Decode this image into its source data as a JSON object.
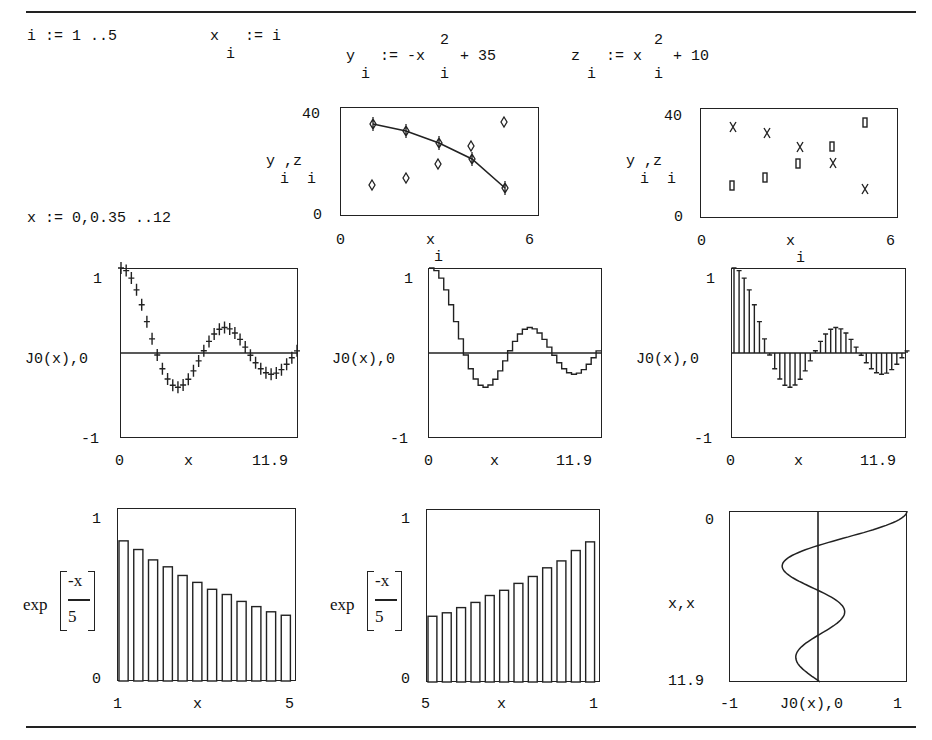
{
  "definitions": {
    "i_range": "i := 1 ..5",
    "x_def": {
      "lhs": "x",
      "sub": "i",
      "rhs": ":= i"
    },
    "y_def": {
      "lhs": "y",
      "sub": "i",
      "assign": ":= -x",
      "sup": "2",
      "sub2": "i",
      "tail": "+ 35"
    },
    "z_def": {
      "lhs": "z",
      "sub": "i",
      "assign": ":= x",
      "sup": "2",
      "sub2": "i",
      "tail": "+ 10"
    },
    "x_range": "x := 0,0.35 ..12"
  },
  "plots": {
    "scatter_line": {
      "ylabel_main": "y ,z",
      "ylabel_subs": "i  i",
      "ymax": "40",
      "ymin": "0",
      "xmin": "0",
      "xmax": "6",
      "xlabel": "x",
      "xlabel_sub": "i"
    },
    "scatter_points": {
      "ylabel_main": "y ,z",
      "ylabel_subs": "i  i",
      "ymax": "40",
      "ymin": "0",
      "xmin": "0",
      "xmax": "6",
      "xlabel": "x",
      "xlabel_sub": "i"
    },
    "j0_points": {
      "ylabel": "J0(x),0",
      "ymax": "1",
      "ymin": "-1",
      "xmin": "0",
      "xmax": "11.9",
      "xlabel": "x"
    },
    "j0_steps": {
      "ylabel": "J0(x),0",
      "ymax": "1",
      "ymin": "-1",
      "xmin": "0",
      "xmax": "11.9",
      "xlabel": "x"
    },
    "j0_stems": {
      "ylabel": "J0(x),0",
      "ymax": "1",
      "ymin": "-1",
      "xmin": "0",
      "xmax": "11.9",
      "xlabel": "x"
    },
    "bars_desc": {
      "ylabel_fn": "exp",
      "ylabel_num": "-x",
      "ylabel_den": "5",
      "ymax": "1",
      "ymin": "0",
      "xmin": "1",
      "xmax": "5",
      "xlabel": "x"
    },
    "bars_asc": {
      "ylabel_fn": "exp",
      "ylabel_num": "-x",
      "ylabel_den": "5",
      "ymax": "1",
      "ymin": "0",
      "xmin": "5",
      "xmax": "1",
      "xlabel": "x"
    },
    "j0_rotated": {
      "ylabel": "x,x",
      "ytop": "0",
      "ybottom": "11.9",
      "xmin": "-1",
      "xmax": "1",
      "xlabel": "J0(x),0"
    }
  },
  "chart_data": [
    {
      "type": "scatter",
      "title": "",
      "xlabel": "x_i",
      "ylabel": "y_i, z_i",
      "xlim": [
        0,
        6
      ],
      "ylim": [
        0,
        40
      ],
      "x": [
        1,
        2,
        3,
        4,
        5
      ],
      "series": [
        {
          "name": "y_i (line + diamond markers)",
          "values": [
            34,
            31,
            26,
            19,
            10
          ]
        },
        {
          "name": "z_i (diamond markers)",
          "values": [
            11,
            14,
            19,
            26,
            35
          ]
        }
      ]
    },
    {
      "type": "scatter",
      "title": "",
      "xlabel": "x_i",
      "ylabel": "y_i, z_i",
      "xlim": [
        0,
        6
      ],
      "ylim": [
        0,
        40
      ],
      "x": [
        1,
        2,
        3,
        4,
        5
      ],
      "series": [
        {
          "name": "y_i (x markers)",
          "values": [
            34,
            31,
            26,
            19,
            10
          ]
        },
        {
          "name": "z_i (box markers)",
          "values": [
            11,
            14,
            19,
            26,
            35
          ]
        }
      ]
    },
    {
      "type": "scatter",
      "title": "",
      "xlabel": "x",
      "ylabel": "J0(x), 0",
      "xlim": [
        0,
        11.9
      ],
      "ylim": [
        -1,
        1
      ],
      "series": [
        {
          "name": "J0(x) (+ markers)",
          "function": "besselJ0",
          "x_start": 0,
          "x_step": 0.35,
          "x_end": 11.9
        },
        {
          "name": "0",
          "values": [
            0
          ]
        }
      ]
    },
    {
      "type": "line",
      "title": "",
      "xlabel": "x",
      "ylabel": "J0(x), 0",
      "xlim": [
        0,
        11.9
      ],
      "ylim": [
        -1,
        1
      ],
      "series": [
        {
          "name": "J0(x) (step)",
          "function": "besselJ0",
          "x_start": 0,
          "x_step": 0.35,
          "x_end": 11.9
        },
        {
          "name": "0",
          "values": [
            0
          ]
        }
      ]
    },
    {
      "type": "bar",
      "title": "",
      "xlabel": "x",
      "ylabel": "J0(x), 0",
      "xlim": [
        0,
        11.9
      ],
      "ylim": [
        -1,
        1
      ],
      "series": [
        {
          "name": "J0(x) (stem/error bars)",
          "function": "besselJ0",
          "x_start": 0,
          "x_step": 0.35,
          "x_end": 11.9
        }
      ]
    },
    {
      "type": "bar",
      "title": "",
      "xlabel": "x",
      "ylabel": "exp(-x/5)",
      "xlim": [
        1,
        5
      ],
      "ylim": [
        0,
        1
      ],
      "categories": [
        1.05,
        1.4,
        1.75,
        2.1,
        2.45,
        2.8,
        3.15,
        3.5,
        3.85,
        4.2,
        4.55,
        4.9
      ],
      "values": [
        0.81,
        0.76,
        0.7,
        0.66,
        0.61,
        0.57,
        0.53,
        0.5,
        0.46,
        0.43,
        0.4,
        0.38
      ]
    },
    {
      "type": "bar",
      "title": "",
      "xlabel": "x",
      "ylabel": "exp(-x/5)",
      "xlim": [
        5,
        1
      ],
      "ylim": [
        0,
        1
      ],
      "categories": [
        4.9,
        4.55,
        4.2,
        3.85,
        3.5,
        3.15,
        2.8,
        2.45,
        2.1,
        1.75,
        1.4,
        1.05
      ],
      "values": [
        0.38,
        0.4,
        0.43,
        0.46,
        0.5,
        0.53,
        0.57,
        0.61,
        0.66,
        0.7,
        0.76,
        0.81
      ]
    },
    {
      "type": "line",
      "title": "",
      "xlabel": "J0(x), 0",
      "ylabel": "x, x",
      "xlim": [
        -1,
        1
      ],
      "ylim": [
        11.9,
        0
      ],
      "series": [
        {
          "name": "J0(x) vs x (rotated)",
          "function": "besselJ0"
        },
        {
          "name": "0 vs x",
          "values": [
            0
          ]
        }
      ]
    }
  ]
}
